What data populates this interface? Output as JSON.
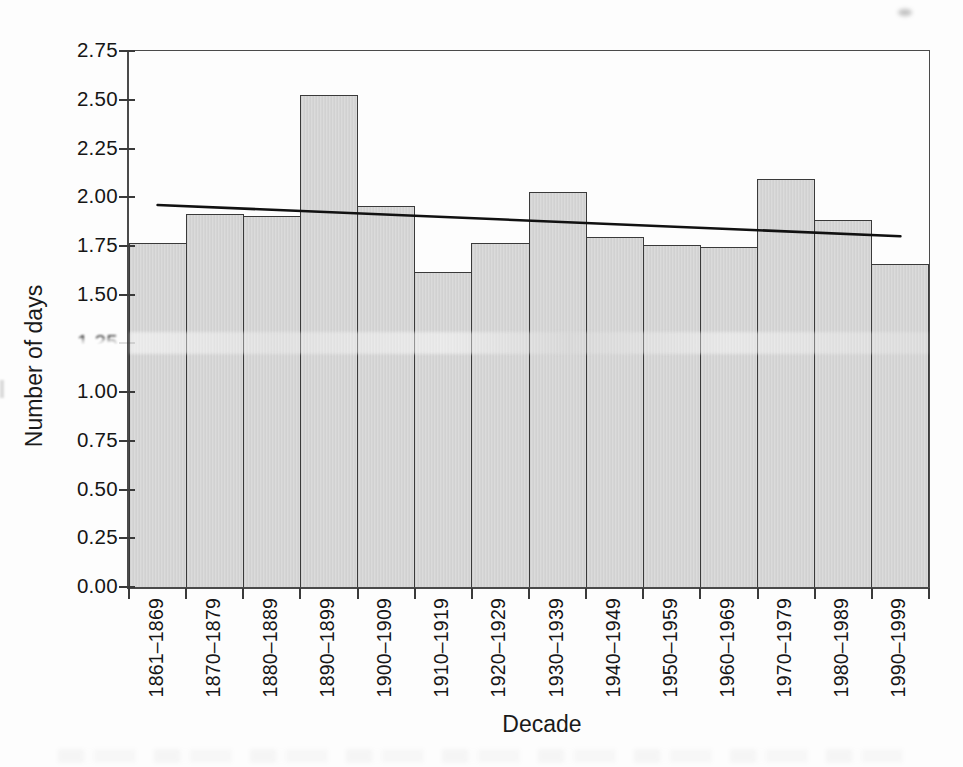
{
  "page": {
    "background": "#fdfdfd"
  },
  "chart_data": {
    "type": "bar",
    "title": "",
    "xlabel": "Decade",
    "ylabel": "Number of days",
    "categories": [
      "1861–1869",
      "1870–1879",
      "1880–1889",
      "1890–1899",
      "1900–1909",
      "1910–1919",
      "1920–1929",
      "1930–1939",
      "1940–1949",
      "1950–1959",
      "1960–1969",
      "1970–1979",
      "1980–1989",
      "1990–1999"
    ],
    "values": [
      1.76,
      1.91,
      1.9,
      2.52,
      1.95,
      1.61,
      1.76,
      2.02,
      1.79,
      1.75,
      1.74,
      2.09,
      1.88,
      1.65
    ],
    "ylim": [
      0,
      2.75
    ],
    "y_ticks": [
      "0.00",
      "0.25",
      "0.50",
      "0.75",
      "1.00",
      "1.25",
      "1.50",
      "1.75",
      "2.00",
      "2.25",
      "2.50",
      "2.75"
    ],
    "grid": false,
    "legend": false,
    "trend_line": {
      "type": "linear",
      "start_value": 1.96,
      "end_value": 1.8
    },
    "colors": {
      "bar_fill": "#d6d6d6",
      "bar_border": "#3a3a3a",
      "axis": "#4a4a4a",
      "trend": "#111111",
      "text": "#1c1c1c"
    }
  },
  "artifacts": {
    "smudged_y_tick_label": "1.25"
  }
}
